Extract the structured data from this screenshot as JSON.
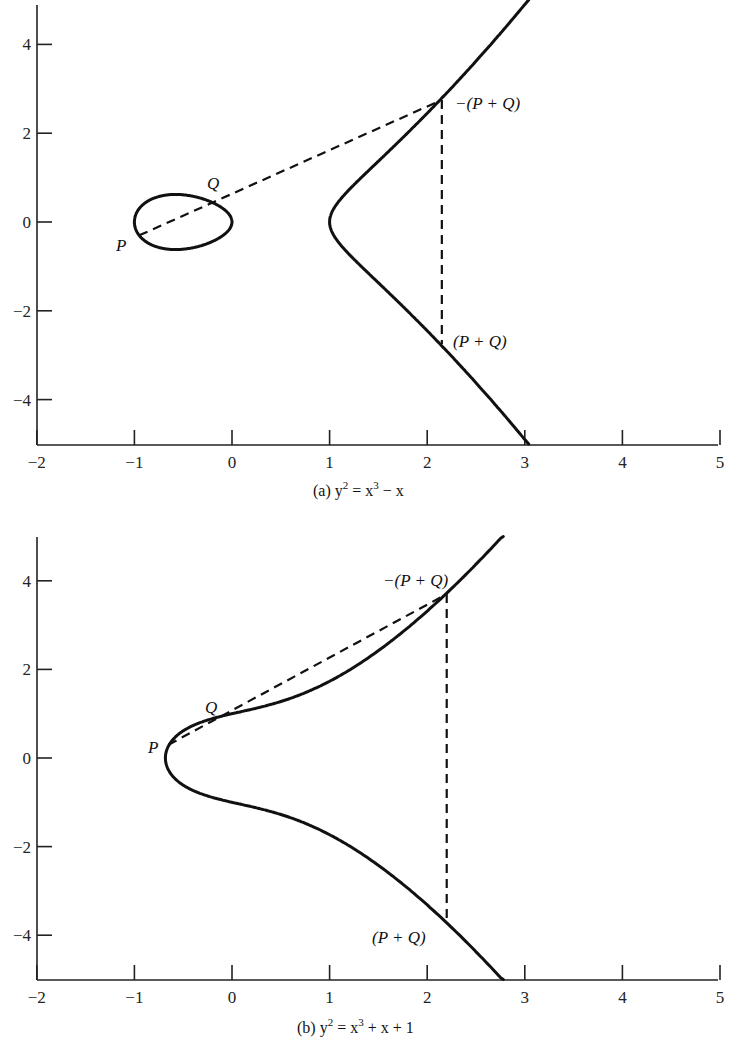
{
  "chart_data": [
    {
      "id": "a",
      "type": "line",
      "title": "",
      "caption": "(a) y² = x³ − x",
      "caption_parts": {
        "prefix": "(a) y",
        "sup1": "2",
        "mid": " = x",
        "sup2": "3",
        "suffix": " − x"
      },
      "equation": "y^2 = x^3 - x",
      "coeff": {
        "a": -1,
        "b": 0
      },
      "xlabel": "",
      "ylabel": "",
      "xlim": [
        -2,
        5
      ],
      "ylim": [
        -5,
        5
      ],
      "x_ticks": [
        -2,
        -1,
        0,
        1,
        2,
        3,
        4,
        5
      ],
      "x_tick_labels": [
        "−2",
        "−1",
        "0",
        "1",
        "2",
        "3",
        "4",
        "5"
      ],
      "y_ticks": [
        4,
        2,
        0,
        -2,
        -4
      ],
      "y_tick_labels": [
        "4",
        "2",
        "0",
        "−2",
        "−4"
      ],
      "grid": false,
      "legend": null,
      "series": [
        {
          "name": "curve oval component",
          "style": "solid",
          "x_range": [
            -1,
            0
          ]
        },
        {
          "name": "curve unbounded component",
          "style": "solid",
          "x_range": [
            1,
            3.05
          ]
        },
        {
          "name": "secant line through P and Q",
          "style": "dashed",
          "from": [
            -0.95,
            -0.3
          ],
          "to": [
            2.15,
            2.75
          ]
        },
        {
          "name": "vertical reflection line",
          "style": "dashed",
          "from": [
            2.15,
            2.75
          ],
          "to": [
            2.15,
            -2.75
          ]
        }
      ],
      "points": [
        {
          "label": "P",
          "x": -0.95,
          "y": -0.3
        },
        {
          "label": "Q",
          "x": -0.3,
          "y": 0.5
        },
        {
          "label": "−(P + Q)",
          "x": 2.15,
          "y": 2.75
        },
        {
          "label": "(P + Q)",
          "x": 2.15,
          "y": -2.75
        }
      ]
    },
    {
      "id": "b",
      "type": "line",
      "title": "",
      "caption": "(b) y² = x³ + x + 1",
      "caption_parts": {
        "prefix": "(b) y",
        "sup1": "2",
        "mid": " = x",
        "sup2": "3",
        "suffix": " + x + 1"
      },
      "equation": "y^2 = x^3 + x + 1",
      "coeff": {
        "a": 1,
        "b": 1
      },
      "xlabel": "",
      "ylabel": "",
      "xlim": [
        -2,
        5
      ],
      "ylim": [
        -5,
        5
      ],
      "x_ticks": [
        -2,
        -1,
        0,
        1,
        2,
        3,
        4,
        5
      ],
      "x_tick_labels": [
        "−2",
        "−1",
        "0",
        "1",
        "2",
        "3",
        "4",
        "5"
      ],
      "y_ticks": [
        4,
        2,
        0,
        -2,
        -4
      ],
      "y_tick_labels": [
        "4",
        "2",
        "0",
        "−2",
        "−4"
      ],
      "grid": false,
      "legend": null,
      "series": [
        {
          "name": "curve",
          "style": "solid",
          "x_range": [
            -0.6823,
            2.78
          ]
        },
        {
          "name": "secant line through P and Q",
          "style": "dashed",
          "from": [
            -0.65,
            0.3
          ],
          "to": [
            2.2,
            3.7
          ]
        },
        {
          "name": "vertical reflection line",
          "style": "dashed",
          "from": [
            2.2,
            3.7
          ],
          "to": [
            2.2,
            -3.7
          ]
        }
      ],
      "points": [
        {
          "label": "P",
          "x": -0.65,
          "y": 0.3
        },
        {
          "label": "Q",
          "x": 0.0,
          "y": 1.0
        },
        {
          "label": "−(P + Q)",
          "x": 2.2,
          "y": 3.7
        },
        {
          "label": "(P + Q)",
          "x": 2.2,
          "y": -3.7
        }
      ]
    }
  ],
  "labels": {
    "a": {
      "P": "P",
      "Q": "Q",
      "neg_sum": "−(P + Q)",
      "sum": "(P + Q)"
    },
    "b": {
      "P": "P",
      "Q": "Q",
      "neg_sum": "−(P + Q)",
      "sum": "(P + Q)"
    }
  },
  "colors": {
    "ink": "#111111",
    "background": "#ffffff"
  }
}
